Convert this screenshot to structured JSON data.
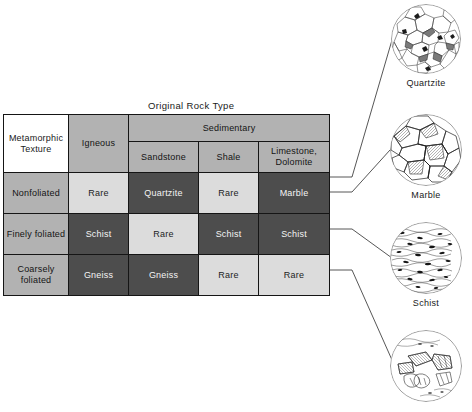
{
  "figure": {
    "table_title": "Original Rock Type",
    "corner_label": "Metamorphic Texture",
    "corner_label_line1": "Metamorphic",
    "corner_label_line2": "Texture"
  },
  "table": {
    "group_headers": [
      {
        "label": "Igneous",
        "span": 1
      },
      {
        "label": "Sedimentary",
        "span": 3
      }
    ],
    "column_headers": [
      "Igneous",
      "Sandstone",
      "Shale",
      "Limestone, Dolomite"
    ],
    "column_header_limestone_line1": "Limestone,",
    "column_header_limestone_line2": "Dolomite",
    "row_labels": [
      "Nonfoliated",
      "Finely foliated",
      "Coarsely foliated"
    ],
    "row_label_coarse_line1": "Coarsely",
    "row_label_coarse_line2": "foliated",
    "rows": [
      {
        "texture": "Nonfoliated",
        "cells": [
          {
            "value": "Rare",
            "shade": "light"
          },
          {
            "value": "Quartzite",
            "shade": "dark"
          },
          {
            "value": "Rare",
            "shade": "light"
          },
          {
            "value": "Marble",
            "shade": "dark"
          }
        ]
      },
      {
        "texture": "Finely foliated",
        "cells": [
          {
            "value": "Schist",
            "shade": "dark"
          },
          {
            "value": "Rare",
            "shade": "light"
          },
          {
            "value": "Schist",
            "shade": "dark"
          },
          {
            "value": "Schist",
            "shade": "dark"
          }
        ]
      },
      {
        "texture": "Coarsely foliated",
        "cells": [
          {
            "value": "Gneiss",
            "shade": "dark"
          },
          {
            "value": "Gneiss",
            "shade": "dark"
          },
          {
            "value": "Rare",
            "shade": "light"
          },
          {
            "value": "Rare",
            "shade": "light"
          }
        ]
      }
    ]
  },
  "specimens": [
    {
      "label": "Quartzite",
      "texture": "interlocking-equigranular-mosaic"
    },
    {
      "label": "Marble",
      "texture": "coarse-interlocking-crystals"
    },
    {
      "label": "Schist",
      "texture": "fine-aligned-foliated-flakes"
    },
    {
      "label": "",
      "texture": "banded-coarse-gneissic"
    }
  ],
  "colors": {
    "shade_light": "#dcdcdc",
    "shade_dark": "#4d4d4d",
    "header_gray": "#b2b2b2",
    "border": "#151515",
    "text_dark": "#1a1a1a",
    "text_light": "#f4f4f4"
  }
}
